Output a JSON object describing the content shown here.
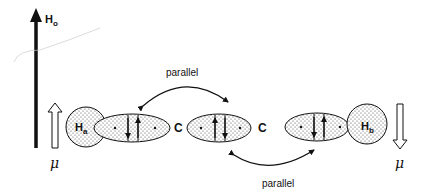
{
  "field": {
    "label": "H",
    "subscript": "o"
  },
  "atoms": {
    "left_h": {
      "label": "H",
      "subscript": "a"
    },
    "right_h": {
      "label": "H",
      "subscript": "b"
    },
    "carbon1": "C",
    "carbon2": "C"
  },
  "moments": {
    "left": "μ",
    "right": "μ"
  },
  "couplings": {
    "top": "parallel",
    "bottom": "parallel"
  },
  "colors": {
    "ink": "#111111",
    "fill": "#ffffff"
  }
}
